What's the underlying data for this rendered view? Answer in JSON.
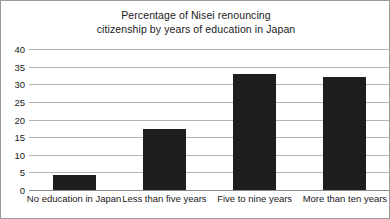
{
  "chart_data": {
    "type": "bar",
    "title": "Percentage of Nisei renouncing citizenship by years of education in Japan",
    "title_lines": [
      "Percentage of Nisei renouncing",
      "citizenship by years of education in Japan"
    ],
    "categories": [
      "No education in Japan",
      "Less than five years",
      "Five to nine years",
      "More than ten years"
    ],
    "values": [
      4.3,
      17.3,
      33.0,
      32.2
    ],
    "xlabel": "",
    "ylabel": "",
    "ylim": [
      0,
      40
    ],
    "yticks": [
      0,
      5,
      10,
      15,
      20,
      25,
      30,
      35,
      40
    ],
    "ytick_labels": [
      "0",
      "5",
      "10",
      "15",
      "20",
      "25",
      "30",
      "35",
      "40"
    ],
    "grid": true,
    "legend": false,
    "legend_position": "none",
    "bar_color": "#1e1e1e",
    "grid_color": "#b4b4b4",
    "axis_color": "#8c8c8c",
    "background_color": "#ffffff",
    "border_color": "#9a9a9a"
  }
}
